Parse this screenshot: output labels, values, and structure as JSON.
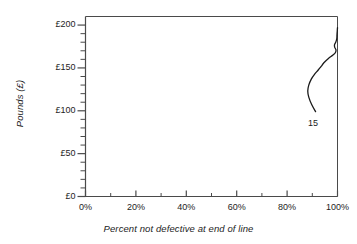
{
  "chart_data": {
    "type": "line",
    "title": "",
    "subtitle": "",
    "xlabel": "Percent not defective at end of line",
    "ylabel": "Pounds (£)",
    "xlim": [
      0,
      100
    ],
    "ylim": [
      0,
      210
    ],
    "grid": false,
    "legend": "none",
    "x_tick_labels": [
      "0%",
      "20%",
      "40%",
      "60%",
      "80%",
      "100%"
    ],
    "x_tick_values": [
      0,
      20,
      40,
      60,
      80,
      100
    ],
    "x_minor_tick_values": [
      10,
      30,
      50,
      70,
      90
    ],
    "y_tick_labels": [
      "£0",
      "£50",
      "£100",
      "£150",
      "£200"
    ],
    "y_tick_values": [
      0,
      50,
      100,
      150,
      200
    ],
    "y_minor_tick_values": [
      10,
      20,
      30,
      40,
      60,
      70,
      80,
      90,
      110,
      120,
      130,
      140,
      160,
      170,
      180,
      190
    ],
    "series": [
      {
        "name": "15",
        "annotation_label": "15",
        "annotation_x": 91.5,
        "annotation_y": 85,
        "x": [
          91.3,
          89.8,
          88.6,
          88.2,
          88.6,
          89.6,
          91.0,
          92.2,
          93.0,
          93.6,
          94.6,
          96.4,
          98.2,
          99.2,
          99.4,
          98.9,
          98.8,
          99.3,
          99.7,
          99.8,
          99.9,
          100.0
        ],
        "y": [
          99,
          107,
          116,
          123,
          130,
          137,
          143,
          147,
          150,
          152,
          156,
          161,
          165,
          168,
          171,
          174,
          177,
          180,
          184,
          189,
          193,
          197
        ]
      }
    ],
    "colors": {
      "line": "#1a1a1a",
      "axis": "#4a4a4a",
      "text": "#1d1d1d",
      "background": "#ffffff"
    }
  }
}
